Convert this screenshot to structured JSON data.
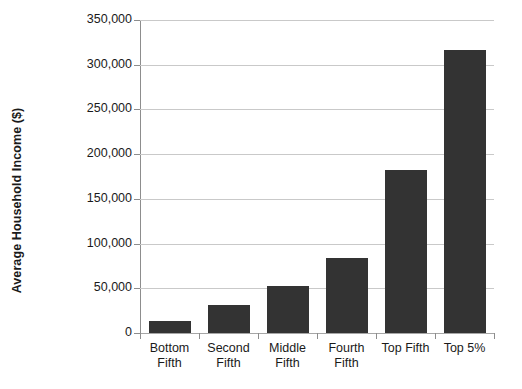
{
  "chart_data": {
    "type": "bar",
    "title": "",
    "xlabel": "",
    "ylabel": "Average Household Income ($)",
    "categories": [
      "Bottom Fifth",
      "Second Fifth",
      "Middle Fifth",
      "Fourth Fifth",
      "Top Fifth",
      "Top 5%"
    ],
    "category_label_lines": [
      [
        "Bottom",
        "Fifth"
      ],
      [
        "Second",
        "Fifth"
      ],
      [
        "Middle",
        "Fifth"
      ],
      [
        "Fourth",
        "Fifth"
      ],
      [
        "Top Fifth"
      ],
      [
        "Top 5%"
      ]
    ],
    "values": [
      13000,
      31000,
      53000,
      84000,
      182000,
      316000
    ],
    "ylim": [
      0,
      350000
    ],
    "ytick_values": [
      0,
      50000,
      100000,
      150000,
      200000,
      250000,
      300000,
      350000
    ],
    "ytick_labels": [
      "0",
      "50,000",
      "100,000",
      "150,000",
      "200,000",
      "250,000",
      "300,000",
      "350,000"
    ],
    "grid": true,
    "grid_axis": "y",
    "legend": false,
    "legend_position": "none",
    "bar_color": "#333333",
    "grid_color": "#c9c9c9",
    "axis_color": "#8d8d8d",
    "background_color": "#ffffff"
  }
}
